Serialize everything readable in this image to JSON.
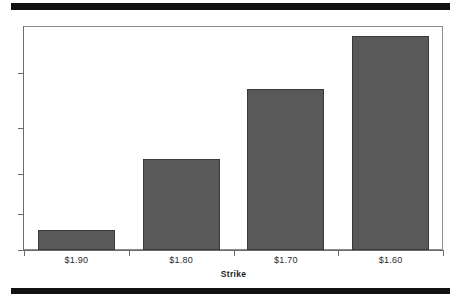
{
  "figure": {
    "decorations": {
      "top_rule": "solid-black-band",
      "bottom_rule": "solid-black-band"
    }
  },
  "chart_data": {
    "type": "bar",
    "title": "",
    "subtitle": "",
    "xlabel": "Strike",
    "ylabel": "",
    "categories": [
      "$1.90",
      "$1.80",
      "$1.70",
      "$1.60"
    ],
    "values": [
      0.09,
      0.41,
      0.72,
      0.96
    ],
    "ylim": [
      0,
      1
    ],
    "y_tick_labels": [],
    "y_tick_fractions": [
      0.0,
      0.16,
      0.34,
      0.545,
      0.79
    ],
    "grid": false,
    "legend": null,
    "legend_position": "none",
    "bar_color": "#595959",
    "bar_edge_color": "#3a3a3a",
    "axis_color": "#6b6b6b",
    "frame_color": "#8c8c8c",
    "background": "#ffffff",
    "annotations": []
  }
}
